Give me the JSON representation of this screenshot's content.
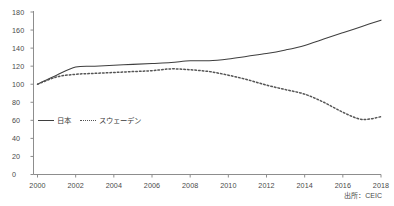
{
  "chart_data": {
    "type": "line",
    "title": "",
    "subtitle": "",
    "xlabel": "",
    "ylabel": "",
    "xlim": [
      2000,
      2018
    ],
    "ylim": [
      0,
      180
    ],
    "grid": false,
    "legend_position": "inside-left",
    "source_note": "出所：CEIC",
    "x": [
      2000,
      2001,
      2002,
      2003,
      2004,
      2005,
      2006,
      2007,
      2008,
      2009,
      2010,
      2011,
      2012,
      2013,
      2014,
      2015,
      2016,
      2017,
      2018
    ],
    "y_ticks": [
      0,
      20,
      40,
      60,
      80,
      100,
      120,
      140,
      160,
      180
    ],
    "x_ticks": [
      2000,
      2002,
      2004,
      2006,
      2008,
      2010,
      2012,
      2014,
      2016,
      2018
    ],
    "series": [
      {
        "name": "日本",
        "style": "solid",
        "color": "#3f3f3f",
        "values": [
          100,
          110,
          119,
          120,
          121,
          122,
          123,
          124,
          126,
          126,
          128,
          131,
          134,
          138,
          143,
          150,
          157,
          164,
          171
        ]
      },
      {
        "name": "スウェーデン",
        "style": "dotted",
        "color": "#555555",
        "values": [
          100,
          108,
          111,
          112,
          113,
          114,
          115,
          117,
          116,
          114,
          110,
          105,
          99,
          94,
          89,
          80,
          69,
          61,
          64
        ]
      }
    ]
  },
  "axes": {
    "y_tick_labels": [
      "0",
      "20",
      "40",
      "60",
      "80",
      "100",
      "120",
      "140",
      "160",
      "180"
    ],
    "x_tick_labels": [
      "2000",
      "2002",
      "2004",
      "2006",
      "2008",
      "2010",
      "2012",
      "2014",
      "2016",
      "2018"
    ]
  },
  "legend": {
    "entries": [
      {
        "label": "日本",
        "style": "solid"
      },
      {
        "label": "スウェーデン",
        "style": "dotted"
      }
    ]
  },
  "footer": {
    "source": "出所：CEIC"
  }
}
